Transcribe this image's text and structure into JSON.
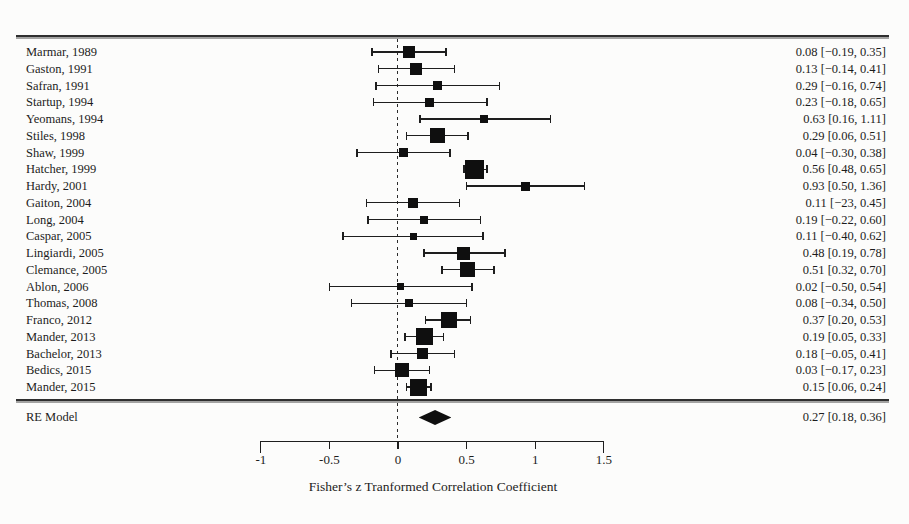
{
  "colors": {
    "ink": "#1c1c1c",
    "background": "#fcfcfb",
    "marker": "#0f0f0f"
  },
  "chart_data": {
    "type": "scatter",
    "subtype": "forest-plot",
    "xlabel": "Fisher’s z Tranformed Correlation Coefficient",
    "xlim": [
      -1,
      1.5
    ],
    "x_ticks": [
      -1,
      -0.5,
      0,
      0.5,
      1,
      1.5
    ],
    "x_tick_labels": [
      "-1",
      "-0.5",
      "0",
      "0.5",
      "1",
      "1.5"
    ],
    "reference_line_x": 0,
    "grid": false,
    "legend": "none",
    "studies": [
      {
        "label": "Marmar, 1989",
        "estimate": 0.08,
        "ci": [
          -0.19,
          0.35
        ],
        "annotation": "0.08 [−0.19, 0.35]",
        "marker_size": 12
      },
      {
        "label": "Gaston, 1991",
        "estimate": 0.13,
        "ci": [
          -0.14,
          0.41
        ],
        "annotation": "0.13 [−0.14, 0.41]",
        "marker_size": 12
      },
      {
        "label": "Safran, 1991",
        "estimate": 0.29,
        "ci": [
          -0.16,
          0.74
        ],
        "annotation": "0.29 [−0.16, 0.74]",
        "marker_size": 9
      },
      {
        "label": "Startup, 1994",
        "estimate": 0.23,
        "ci": [
          -0.18,
          0.65
        ],
        "annotation": "0.23 [−0.18, 0.65]",
        "marker_size": 9
      },
      {
        "label": "Yeomans, 1994",
        "estimate": 0.63,
        "ci": [
          0.16,
          1.11
        ],
        "annotation": "0.63 [0.16, 1.11]",
        "marker_size": 8
      },
      {
        "label": "Stiles, 1998",
        "estimate": 0.29,
        "ci": [
          0.06,
          0.51
        ],
        "annotation": "0.29 [0.06, 0.51]",
        "marker_size": 15
      },
      {
        "label": "Shaw, 1999",
        "estimate": 0.04,
        "ci": [
          -0.3,
          0.38
        ],
        "annotation": "0.04 [−0.30, 0.38]",
        "marker_size": 9
      },
      {
        "label": "Hatcher, 1999",
        "estimate": 0.56,
        "ci": [
          0.48,
          0.65
        ],
        "annotation": "0.56 [0.48, 0.65]",
        "marker_size": 19
      },
      {
        "label": "Hardy, 2001",
        "estimate": 0.93,
        "ci": [
          0.5,
          1.36
        ],
        "annotation": "0.93 [0.50, 1.36]",
        "marker_size": 9
      },
      {
        "label": "Gaiton, 2004",
        "estimate": 0.11,
        "ci": [
          -0.23,
          0.45
        ],
        "annotation": "0.11 [−23, 0.45]",
        "marker_size": 10
      },
      {
        "label": "Long, 2004",
        "estimate": 0.19,
        "ci": [
          -0.22,
          0.6
        ],
        "annotation": "0.19 [−0.22, 0.60]",
        "marker_size": 8
      },
      {
        "label": "Caspar, 2005",
        "estimate": 0.11,
        "ci": [
          -0.4,
          0.62
        ],
        "annotation": "0.11 [−0.40, 0.62]",
        "marker_size": 7
      },
      {
        "label": "Lingiardi, 2005",
        "estimate": 0.48,
        "ci": [
          0.19,
          0.78
        ],
        "annotation": "0.48 [0.19, 0.78]",
        "marker_size": 13
      },
      {
        "label": "Clemance, 2005",
        "estimate": 0.51,
        "ci": [
          0.32,
          0.7
        ],
        "annotation": "0.51 [0.32, 0.70]",
        "marker_size": 15
      },
      {
        "label": "Ablon, 2006",
        "estimate": 0.02,
        "ci": [
          -0.5,
          0.54
        ],
        "annotation": "0.02 [−0.50, 0.54]",
        "marker_size": 7
      },
      {
        "label": "Thomas, 2008",
        "estimate": 0.08,
        "ci": [
          -0.34,
          0.5
        ],
        "annotation": "0.08 [−0.34, 0.50]",
        "marker_size": 8
      },
      {
        "label": "Franco, 2012",
        "estimate": 0.37,
        "ci": [
          0.2,
          0.53
        ],
        "annotation": "0.37 [0.20, 0.53]",
        "marker_size": 16
      },
      {
        "label": "Mander, 2013",
        "estimate": 0.19,
        "ci": [
          0.05,
          0.33
        ],
        "annotation": "0.19 [0.05, 0.33]",
        "marker_size": 17
      },
      {
        "label": "Bachelor, 2013",
        "estimate": 0.18,
        "ci": [
          -0.05,
          0.41
        ],
        "annotation": "0.18 [−0.05, 0.41]",
        "marker_size": 11
      },
      {
        "label": "Bedics, 2015",
        "estimate": 0.03,
        "ci": [
          -0.17,
          0.23
        ],
        "annotation": "0.03 [−0.17, 0.23]",
        "marker_size": 14
      },
      {
        "label": "Mander, 2015",
        "estimate": 0.15,
        "ci": [
          0.06,
          0.24
        ],
        "annotation": "0.15 [0.06, 0.24]",
        "marker_size": 17
      }
    ],
    "summary": {
      "label": "RE Model",
      "estimate": 0.27,
      "ci": [
        0.18,
        0.36
      ],
      "annotation": "0.27 [0.18, 0.36]"
    }
  }
}
